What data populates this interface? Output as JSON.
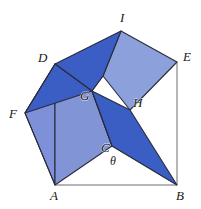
{
  "figure": {
    "width": 201,
    "height": 209,
    "background": "#ffffff",
    "colors": {
      "dark_blue": "#3a5ec4",
      "mid_blue": "#4a6bcc",
      "light_blue": "#7e91d8",
      "pale_blue": "#8d9edd",
      "outline": "#2b2b3a",
      "label_text": "#171717",
      "thin_line": "#5a5a6a"
    },
    "labels": [
      {
        "id": "label-I",
        "text": "I",
        "x": 120,
        "y": 11,
        "italic": true
      },
      {
        "id": "label-D",
        "text": "D",
        "x": 38,
        "y": 51,
        "italic": true
      },
      {
        "id": "label-E",
        "text": "E",
        "x": 183,
        "y": 50,
        "italic": true
      },
      {
        "id": "label-F",
        "text": "F",
        "x": 9,
        "y": 107,
        "italic": true
      },
      {
        "id": "label-G",
        "text": "G",
        "x": 80,
        "y": 89,
        "italic": true
      },
      {
        "id": "label-H",
        "text": "H",
        "x": 133,
        "y": 96,
        "italic": true
      },
      {
        "id": "label-C",
        "text": "C",
        "x": 101,
        "y": 141,
        "italic": true
      },
      {
        "id": "label-theta",
        "text": "θ",
        "x": 110,
        "y": 155,
        "italic": true
      },
      {
        "id": "label-A",
        "text": "A",
        "x": 50,
        "y": 189,
        "italic": true
      },
      {
        "id": "label-B",
        "text": "B",
        "x": 176,
        "y": 189,
        "italic": true
      }
    ],
    "vertices": {
      "A": [
        55,
        185
      ],
      "B": [
        177,
        185
      ],
      "C": [
        112,
        146
      ],
      "D": [
        55,
        64
      ],
      "E": [
        177,
        62
      ],
      "F": [
        25,
        113
      ],
      "G": [
        92,
        91
      ],
      "H": [
        130,
        110
      ],
      "I": [
        121,
        31
      ]
    },
    "polygons": [
      {
        "id": "square-ACGD",
        "name": "square-on-AC",
        "points": "55,185 112,146 92,91 55,64",
        "fill": "#8094d6",
        "stroke": "#2b2b3a",
        "stroke_width": 1.1
      },
      {
        "id": "triangle-DFA",
        "name": "triangle-left-lower",
        "points": "55,64 25,113 55,185",
        "fill": "#7e91d8",
        "stroke": "#2b2b3a",
        "stroke_width": 1.1
      },
      {
        "id": "triangle-DFG",
        "name": "triangle-left-dark-flap",
        "points": "55,64 25,113 92,91",
        "fill": "#3a5ec4",
        "stroke": "#2b2b3a",
        "stroke_width": 1.1
      },
      {
        "id": "quad-DIG",
        "name": "dark-flap-top-left",
        "points": "55,64 121,31 103,76 92,91",
        "fill": "#3a5ec4",
        "stroke": "#2b2b3a",
        "stroke_width": 1.1
      },
      {
        "id": "quad-IEHG",
        "name": "light-flap-top-right",
        "points": "121,31 177,62 130,110 103,76",
        "fill": "#8ca0dc",
        "stroke": "#2b2b3a",
        "stroke_width": 1.1
      },
      {
        "id": "quad-GHB-dark",
        "name": "dark-flap-right-lower",
        "points": "92,91 130,110 177,185 112,146",
        "fill": "#3a5ec4",
        "stroke": "#2b2b3a",
        "stroke_width": 1.1
      }
    ],
    "thin_edges": [
      {
        "id": "edge-AB",
        "name": "base-edge-A-to-B",
        "x1": 55,
        "y1": 185,
        "x2": 177,
        "y2": 185
      },
      {
        "id": "edge-BE",
        "name": "right-edge-B-to-E",
        "x1": 177,
        "y1": 185,
        "x2": 177,
        "y2": 62
      },
      {
        "id": "edge-DE",
        "name": "top-edge-D-to-E",
        "x1": 55,
        "y1": 64,
        "x2": 177,
        "y2": 62
      },
      {
        "id": "edge-DF",
        "name": "edge-D-to-F",
        "x1": 55,
        "y1": 64,
        "x2": 25,
        "y2": 113
      },
      {
        "id": "edge-FA",
        "name": "edge-F-to-A",
        "x1": 25,
        "y1": 113,
        "x2": 55,
        "y2": 185
      },
      {
        "id": "edge-CB",
        "name": "edge-C-to-B",
        "x1": 112,
        "y1": 146,
        "x2": 177,
        "y2": 185
      }
    ]
  }
}
